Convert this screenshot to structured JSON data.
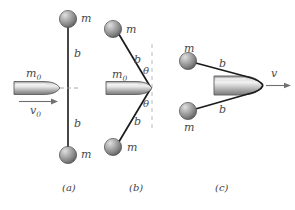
{
  "figure": {
    "colors": {
      "stroke": "#1a1a1a",
      "label": "#4a4a4a",
      "sphere_light": "#d8d8d8",
      "sphere_mid": "#9a9a9a",
      "sphere_dark": "#5e5e5e",
      "bullet_light": "#e2e2e2",
      "bullet_mid": "#a8a8a8",
      "bullet_dark": "#6f6f6f",
      "dash_gray": "#b3b3b3",
      "background": "#ffffff"
    }
  },
  "panels": [
    {
      "id": "a",
      "caption": "(a)",
      "labels": {
        "mass_top": "m",
        "mass_bottom": "m",
        "string_top": "b",
        "string_bottom": "b",
        "bullet_mass": "m0",
        "bullet_mass_base": "m",
        "bullet_mass_sub": "0",
        "velocity": "v0",
        "velocity_base": "v",
        "velocity_sub": "0"
      }
    },
    {
      "id": "b",
      "caption": "(b)",
      "labels": {
        "mass_top": "m",
        "mass_bottom": "m",
        "string_top": "b",
        "string_bottom": "b",
        "angle_top": "θ",
        "angle_bottom": "θ",
        "bullet_mass_base": "m",
        "bullet_mass_sub": "0"
      }
    },
    {
      "id": "c",
      "caption": "(c)",
      "labels": {
        "mass_top": "m",
        "mass_bottom": "m",
        "string_top": "b",
        "string_bottom": "b",
        "velocity": "v"
      }
    }
  ]
}
